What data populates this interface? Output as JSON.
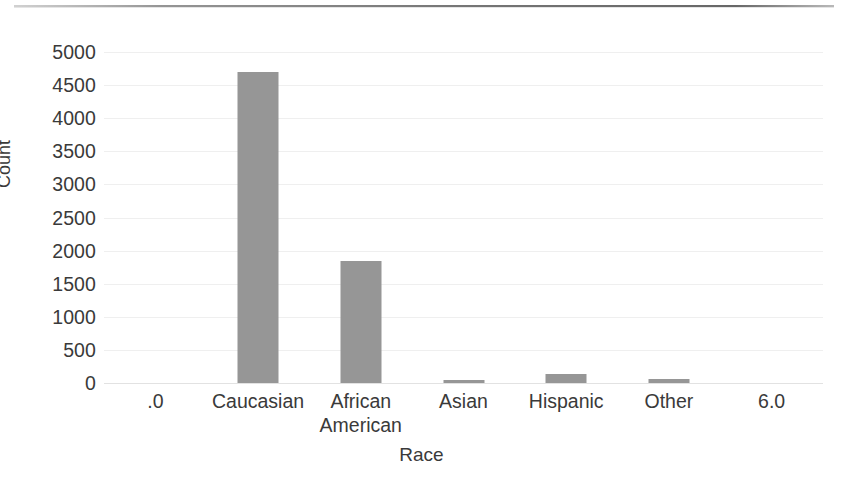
{
  "chart_data": {
    "type": "bar",
    "title": "",
    "subtitle": "",
    "xlabel": "Race",
    "ylabel": "Count",
    "categories": [
      ".0",
      "Caucasian",
      "African American",
      "Asian",
      "Hispanic",
      "Other",
      "6.0"
    ],
    "category_lines": [
      [
        ".0"
      ],
      [
        "Caucasian"
      ],
      [
        "African",
        "American"
      ],
      [
        "Asian"
      ],
      [
        "Hispanic"
      ],
      [
        "Other"
      ],
      [
        "6.0"
      ]
    ],
    "values": [
      0,
      4700,
      1850,
      50,
      140,
      60,
      0
    ],
    "ylim": [
      0,
      5000
    ],
    "yticks": [
      5000,
      4500,
      4000,
      3500,
      3000,
      2500,
      2000,
      1500,
      1000,
      500,
      0
    ],
    "ytick_labels": [
      "5000",
      "4500",
      "4000",
      "3500",
      "3000",
      "2500",
      "2000",
      "1500",
      "1000",
      "500",
      "0"
    ],
    "grid": true,
    "grid_axis": "y",
    "legend": false,
    "legend_position": "none",
    "bar_color": "#969696",
    "grid_color": "#efefef",
    "axis_color": "#e2e2e2",
    "text_color": "#3a3a3a",
    "background_color": "#ffffff"
  }
}
